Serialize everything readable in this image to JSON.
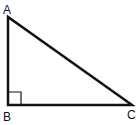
{
  "diagram": {
    "type": "right-triangle",
    "stroke_color": "#111111",
    "background": "#ffffff",
    "vertices": [
      {
        "label": "A",
        "x": 8,
        "y": 17,
        "label_x": 3,
        "label_y": 14
      },
      {
        "label": "B",
        "x": 8,
        "y": 105,
        "label_x": 3,
        "label_y": 121
      },
      {
        "label": "C",
        "x": 132,
        "y": 105,
        "label_x": 127,
        "label_y": 119
      }
    ],
    "right_angle_marker": {
      "at": "B",
      "size": 13
    }
  }
}
